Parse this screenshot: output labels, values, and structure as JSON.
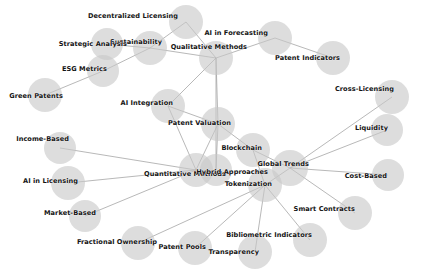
{
  "graph": {
    "title": "Patent Valuation Concept Network",
    "background_color": "#ffffff",
    "node_color": "#c8c8c8",
    "edge_color": "#999999",
    "label_color": "#141414",
    "node_count": 26,
    "edge_count": 30,
    "nodes": [
      {
        "id": "decentralized-licensing",
        "label": "Decentralized Licensing",
        "x": 186,
        "y": 22,
        "r": 17,
        "label_x": 178,
        "label_y": 16
      },
      {
        "id": "ai-in-forecasting",
        "label": "AI in Forecasting",
        "x": 275,
        "y": 38,
        "r": 17,
        "label_x": 268,
        "label_y": 33
      },
      {
        "id": "sustainability",
        "label": "Sustainability",
        "x": 150,
        "y": 48,
        "r": 17,
        "label_x": 162,
        "label_y": 42
      },
      {
        "id": "strategic-analysis",
        "label": "Strategic Analysis",
        "x": 107,
        "y": 44,
        "r": 16,
        "label_x": 127,
        "label_y": 44
      },
      {
        "id": "qualitative-methods",
        "label": "Qualitative Methods",
        "x": 216,
        "y": 58,
        "r": 17,
        "label_x": 247,
        "label_y": 47
      },
      {
        "id": "patent-indicators",
        "label": "Patent Indicators",
        "x": 333,
        "y": 58,
        "r": 17,
        "label_x": 340,
        "label_y": 58
      },
      {
        "id": "esg-metrics",
        "label": "ESG Metrics",
        "x": 103,
        "y": 71,
        "r": 16,
        "label_x": 107,
        "label_y": 69
      },
      {
        "id": "green-patents",
        "label": "Green Patents",
        "x": 45,
        "y": 95,
        "r": 17,
        "label_x": 63,
        "label_y": 96
      },
      {
        "id": "cross-licensing",
        "label": "Cross-Licensing",
        "x": 392,
        "y": 97,
        "r": 17,
        "label_x": 394,
        "label_y": 89
      },
      {
        "id": "ai-integration",
        "label": "AI Integration",
        "x": 168,
        "y": 106,
        "r": 17,
        "label_x": 173,
        "label_y": 103
      },
      {
        "id": "patent-valuation",
        "label": "Patent Valuation",
        "x": 218,
        "y": 124,
        "r": 17,
        "label_x": 231,
        "label_y": 123
      },
      {
        "id": "liquidity",
        "label": "Liquidity",
        "x": 387,
        "y": 130,
        "r": 16,
        "label_x": 388,
        "label_y": 128
      },
      {
        "id": "income-based",
        "label": "Income-Based",
        "x": 60,
        "y": 148,
        "r": 16,
        "label_x": 69,
        "label_y": 139
      },
      {
        "id": "blockchain",
        "label": "Blockchain",
        "x": 253,
        "y": 150,
        "r": 17,
        "label_x": 262,
        "label_y": 148
      },
      {
        "id": "global-trends",
        "label": "Global Trends",
        "x": 290,
        "y": 168,
        "r": 18,
        "label_x": 309,
        "label_y": 164
      },
      {
        "id": "quantitative-methods",
        "label": "Quantitative Methods",
        "x": 196,
        "y": 170,
        "r": 17,
        "label_x": 226,
        "label_y": 174
      },
      {
        "id": "hybrid-approaches",
        "label": "Hybrid Approaches",
        "x": 216,
        "y": 170,
        "r": 16,
        "label_x": 268,
        "label_y": 172
      },
      {
        "id": "cost-based",
        "label": "Cost-Based",
        "x": 388,
        "y": 175,
        "r": 16,
        "label_x": 387,
        "label_y": 176
      },
      {
        "id": "ai-in-licensing",
        "label": "AI in Licensing",
        "x": 68,
        "y": 183,
        "r": 17,
        "label_x": 78,
        "label_y": 181
      },
      {
        "id": "tokenization",
        "label": "Tokenization",
        "x": 265,
        "y": 185,
        "r": 17,
        "label_x": 272,
        "label_y": 184
      },
      {
        "id": "smart-contracts",
        "label": "Smart Contracts",
        "x": 355,
        "y": 213,
        "r": 17,
        "label_x": 355,
        "label_y": 209
      },
      {
        "id": "market-based",
        "label": "Market-Based",
        "x": 85,
        "y": 216,
        "r": 16,
        "label_x": 96,
        "label_y": 213
      },
      {
        "id": "bibliometric-indicators",
        "label": "Bibliometric Indicators",
        "x": 310,
        "y": 240,
        "r": 17,
        "label_x": 312,
        "label_y": 235
      },
      {
        "id": "fractional-ownership",
        "label": "Fractional Ownership",
        "x": 138,
        "y": 243,
        "r": 17,
        "label_x": 157,
        "label_y": 242
      },
      {
        "id": "patent-pools",
        "label": "Patent Pools",
        "x": 195,
        "y": 248,
        "r": 17,
        "label_x": 206,
        "label_y": 247
      },
      {
        "id": "transparency",
        "label": "Transparency",
        "x": 255,
        "y": 252,
        "r": 17,
        "label_x": 259,
        "label_y": 252
      }
    ],
    "edges": [
      {
        "source": "strategic-analysis",
        "target": "sustainability"
      },
      {
        "source": "sustainability",
        "target": "decentralized-licensing"
      },
      {
        "source": "sustainability",
        "target": "qualitative-methods"
      },
      {
        "source": "sustainability",
        "target": "esg-metrics"
      },
      {
        "source": "esg-metrics",
        "target": "green-patents"
      },
      {
        "source": "ai-in-forecasting",
        "target": "qualitative-methods"
      },
      {
        "source": "ai-in-forecasting",
        "target": "patent-indicators"
      },
      {
        "source": "qualitative-methods",
        "target": "patent-valuation"
      },
      {
        "source": "qualitative-methods",
        "target": "ai-integration"
      },
      {
        "source": "qualitative-methods",
        "target": "hybrid-approaches"
      },
      {
        "source": "decentralized-licensing",
        "target": "qualitative-methods"
      },
      {
        "source": "ai-integration",
        "target": "patent-valuation"
      },
      {
        "source": "ai-integration",
        "target": "quantitative-methods"
      },
      {
        "source": "patent-valuation",
        "target": "blockchain"
      },
      {
        "source": "patent-valuation",
        "target": "quantitative-methods"
      },
      {
        "source": "patent-valuation",
        "target": "hybrid-approaches"
      },
      {
        "source": "blockchain",
        "target": "global-trends"
      },
      {
        "source": "blockchain",
        "target": "tokenization"
      },
      {
        "source": "cross-licensing",
        "target": "global-trends"
      },
      {
        "source": "liquidity",
        "target": "global-trends"
      },
      {
        "source": "cost-based",
        "target": "global-trends"
      },
      {
        "source": "global-trends",
        "target": "tokenization"
      },
      {
        "source": "global-trends",
        "target": "smart-contracts"
      },
      {
        "source": "quantitative-methods",
        "target": "income-based"
      },
      {
        "source": "quantitative-methods",
        "target": "ai-in-licensing"
      },
      {
        "source": "quantitative-methods",
        "target": "market-based"
      },
      {
        "source": "tokenization",
        "target": "fractional-ownership"
      },
      {
        "source": "tokenization",
        "target": "patent-pools"
      },
      {
        "source": "tokenization",
        "target": "transparency"
      },
      {
        "source": "tokenization",
        "target": "bibliometric-indicators"
      }
    ]
  }
}
